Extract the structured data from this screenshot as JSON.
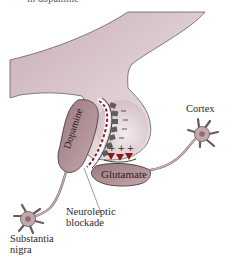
{
  "caption_fragment": "in dopamine",
  "labels": {
    "dopamine": "Dopamine",
    "glutamate": "Glutamate",
    "cortex": "Cortex",
    "neuroleptic_line1": "Neuroleptic",
    "neuroleptic_line2": "blockade",
    "substantia_line1": "Substantia",
    "substantia_line2": "nigra"
  },
  "symbols": {
    "plus_signs": "+ + +",
    "minus_count": 4,
    "receptor_count": 3
  },
  "colors": {
    "neuron_fill": "#cdb3b8",
    "neuron_fill_light": "#efe6e8",
    "outline": "#5a4a4e",
    "terminal_fill": "#a57f87",
    "receptor_dark": "#5a5a5a",
    "glutamate_receptor": "#8b1a1a",
    "blockade_dash": "#8b1a2a"
  }
}
